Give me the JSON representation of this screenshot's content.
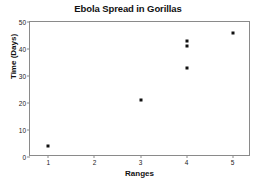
{
  "chart_data": {
    "type": "scatter",
    "title": "Ebola Spread in Gorillas",
    "xlabel": "Ranges",
    "ylabel": "Time (Days)",
    "xlim": [
      0.6,
      5.4
    ],
    "ylim": [
      0,
      50
    ],
    "grid": false,
    "legend": null,
    "x_ticks": [
      1,
      2,
      3,
      4,
      5
    ],
    "x_tick_labels": [
      "1",
      "2",
      "3",
      "4",
      "5"
    ],
    "y_ticks": [
      0,
      10,
      20,
      30,
      40,
      50
    ],
    "y_tick_labels": [
      "0",
      "10",
      "20",
      "30",
      "40",
      "50"
    ],
    "marker": "square",
    "marker_color": "#111111",
    "points": [
      {
        "x": 1,
        "y": 4
      },
      {
        "x": 3,
        "y": 21
      },
      {
        "x": 4,
        "y": 43
      },
      {
        "x": 4,
        "y": 41
      },
      {
        "x": 4,
        "y": 33
      },
      {
        "x": 5,
        "y": 46
      }
    ]
  }
}
